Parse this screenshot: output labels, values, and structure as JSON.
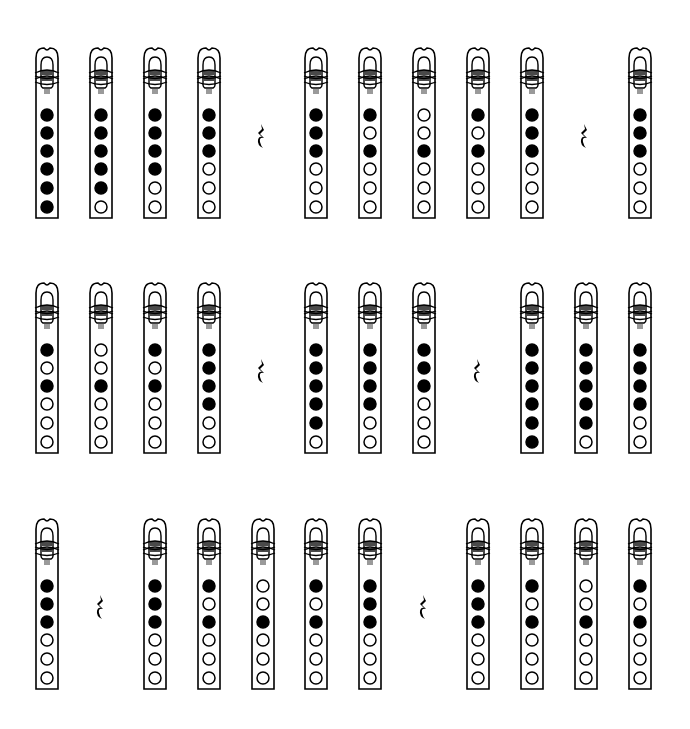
{
  "diagram": {
    "title": "",
    "legend": {
      "closed": "filled hole (covered)",
      "open": "empty hole (uncovered)"
    },
    "colors": {
      "ink": "#000000",
      "paper": "#ffffff",
      "band": "#4a4a4a",
      "band_light": "#9a9a9a"
    },
    "rows": [
      {
        "y": 46,
        "items": [
          {
            "type": "flute",
            "x": 47,
            "holes": [
              1,
              1,
              1,
              1,
              1,
              1
            ]
          },
          {
            "type": "flute",
            "x": 101,
            "holes": [
              1,
              1,
              1,
              1,
              1,
              0
            ]
          },
          {
            "type": "flute",
            "x": 155,
            "holes": [
              1,
              1,
              1,
              1,
              0,
              0
            ]
          },
          {
            "type": "flute",
            "x": 209,
            "holes": [
              1,
              1,
              1,
              0,
              0,
              0
            ]
          },
          {
            "type": "rest",
            "x": 262
          },
          {
            "type": "flute",
            "x": 316,
            "holes": [
              1,
              1,
              1,
              0,
              0,
              0
            ]
          },
          {
            "type": "flute",
            "x": 370,
            "holes": [
              1,
              0,
              1,
              0,
              0,
              0
            ]
          },
          {
            "type": "flute",
            "x": 424,
            "holes": [
              0,
              0,
              1,
              0,
              0,
              0
            ]
          },
          {
            "type": "flute",
            "x": 478,
            "holes": [
              1,
              0,
              1,
              0,
              0,
              0
            ]
          },
          {
            "type": "flute",
            "x": 532,
            "holes": [
              1,
              1,
              1,
              0,
              0,
              0
            ]
          },
          {
            "type": "rest",
            "x": 585
          },
          {
            "type": "flute",
            "x": 640,
            "holes": [
              1,
              1,
              1,
              0,
              0,
              0
            ]
          }
        ]
      },
      {
        "y": 281,
        "items": [
          {
            "type": "flute",
            "x": 47,
            "holes": [
              1,
              0,
              1,
              0,
              0,
              0
            ]
          },
          {
            "type": "flute",
            "x": 101,
            "holes": [
              0,
              0,
              1,
              0,
              0,
              0
            ]
          },
          {
            "type": "flute",
            "x": 155,
            "holes": [
              1,
              0,
              1,
              0,
              0,
              0
            ]
          },
          {
            "type": "flute",
            "x": 209,
            "holes": [
              1,
              1,
              1,
              1,
              0,
              0
            ]
          },
          {
            "type": "rest",
            "x": 262
          },
          {
            "type": "flute",
            "x": 316,
            "holes": [
              1,
              1,
              1,
              1,
              1,
              0
            ]
          },
          {
            "type": "flute",
            "x": 370,
            "holes": [
              1,
              1,
              1,
              1,
              0,
              0
            ]
          },
          {
            "type": "flute",
            "x": 424,
            "holes": [
              1,
              1,
              1,
              0,
              0,
              0
            ]
          },
          {
            "type": "rest",
            "x": 478
          },
          {
            "type": "flute",
            "x": 532,
            "holes": [
              1,
              1,
              1,
              1,
              1,
              1
            ]
          },
          {
            "type": "flute",
            "x": 586,
            "holes": [
              1,
              1,
              1,
              1,
              1,
              0
            ]
          },
          {
            "type": "flute",
            "x": 640,
            "holes": [
              1,
              1,
              1,
              1,
              0,
              0
            ]
          }
        ]
      },
      {
        "y": 517,
        "items": [
          {
            "type": "flute",
            "x": 47,
            "holes": [
              1,
              1,
              1,
              0,
              0,
              0
            ]
          },
          {
            "type": "rest",
            "x": 101
          },
          {
            "type": "flute",
            "x": 155,
            "holes": [
              1,
              1,
              1,
              0,
              0,
              0
            ]
          },
          {
            "type": "flute",
            "x": 209,
            "holes": [
              1,
              0,
              1,
              0,
              0,
              0
            ]
          },
          {
            "type": "flute",
            "x": 263,
            "holes": [
              0,
              0,
              1,
              0,
              0,
              0
            ]
          },
          {
            "type": "flute",
            "x": 316,
            "holes": [
              1,
              0,
              1,
              0,
              0,
              0
            ]
          },
          {
            "type": "flute",
            "x": 370,
            "holes": [
              1,
              1,
              1,
              0,
              0,
              0
            ]
          },
          {
            "type": "rest",
            "x": 424
          },
          {
            "type": "flute",
            "x": 478,
            "holes": [
              1,
              1,
              1,
              0,
              0,
              0
            ]
          },
          {
            "type": "flute",
            "x": 532,
            "holes": [
              1,
              0,
              1,
              0,
              0,
              0
            ]
          },
          {
            "type": "flute",
            "x": 586,
            "holes": [
              0,
              0,
              1,
              0,
              0,
              0
            ]
          },
          {
            "type": "flute",
            "x": 640,
            "holes": [
              1,
              0,
              1,
              0,
              0,
              0
            ]
          }
        ]
      }
    ]
  }
}
